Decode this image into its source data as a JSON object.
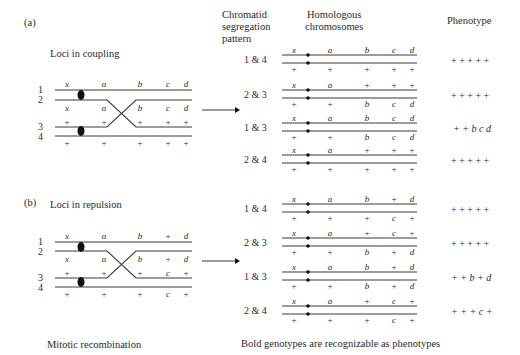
{
  "panel_a": {
    "label": "(a)",
    "title": "Loci in coupling",
    "strand_numbers": [
      "1",
      "2",
      "3",
      "4"
    ],
    "top_pair_labels": [
      "x",
      "a",
      "b",
      "c",
      "d"
    ],
    "bottom_pair_labels": [
      "+",
      "+",
      "+",
      "+",
      "+"
    ],
    "rows": [
      {
        "pattern": "1 & 4",
        "top": [
          "x",
          "a",
          "b",
          "c",
          "d"
        ],
        "bottom": [
          "+",
          "+",
          "+",
          "+",
          "+"
        ],
        "phenotype": "+ + + + +"
      },
      {
        "pattern": "2 & 3",
        "top": [
          "x",
          "a",
          "+",
          "+",
          "+"
        ],
        "bottom": [
          "+",
          "+",
          "b",
          "c",
          "d"
        ],
        "phenotype": "+ + + + +"
      },
      {
        "pattern": "1 & 3",
        "top": [
          "x",
          "a",
          "b",
          "c",
          "d"
        ],
        "bottom": [
          "+",
          "+",
          "b",
          "c",
          "d"
        ],
        "phenotype": "+ + b c d"
      },
      {
        "pattern": "2 & 4",
        "top": [
          "x",
          "a",
          "+",
          "+",
          "+"
        ],
        "bottom": [
          "+",
          "+",
          "+",
          "+",
          "+"
        ],
        "phenotype": "+ + + + +"
      }
    ]
  },
  "panel_b": {
    "label": "(b)",
    "title": "Loci in repulsion",
    "strand_numbers": [
      "1",
      "2",
      "3",
      "4"
    ],
    "top_pair_labels": [
      "x",
      "a",
      "b",
      "+",
      "d"
    ],
    "bottom_pair_labels": [
      "+",
      "+",
      "+",
      "c",
      "+"
    ],
    "rows": [
      {
        "pattern": "1 & 4",
        "top": [
          "x",
          "a",
          "b",
          "+",
          "d"
        ],
        "bottom": [
          "+",
          "+",
          "+",
          "c",
          "+"
        ],
        "phenotype": "+ + + + +"
      },
      {
        "pattern": "2 & 3",
        "top": [
          "x",
          "a",
          "+",
          "c",
          "+"
        ],
        "bottom": [
          "+",
          "+",
          "b",
          "+",
          "d"
        ],
        "phenotype": "+ + + + +"
      },
      {
        "pattern": "1 & 3",
        "top": [
          "x",
          "a",
          "b",
          "+",
          "d"
        ],
        "bottom": [
          "+",
          "+",
          "b",
          "+",
          "d"
        ],
        "phenotype": "+ + b + d"
      },
      {
        "pattern": "2 & 4",
        "top": [
          "x",
          "a",
          "+",
          "c",
          "+"
        ],
        "bottom": [
          "+",
          "+",
          "+",
          "c",
          "+"
        ],
        "phenotype": "+ + + c +"
      }
    ]
  },
  "headers": {
    "segregation_line1": "Chromatid",
    "segregation_line2": "segregation",
    "segregation_line3": "pattern",
    "homologous_line1": "Homologous",
    "homologous_line2": "chromosomes",
    "phenotype": "Phenotype"
  },
  "footer": {
    "left_caption": "Mitotic recombination",
    "right_caption": "Bold genotypes are recognizable as phenotypes"
  },
  "colors": {
    "line": "#3a3a3a",
    "text": "#2a2a2a",
    "background": "#ffffff"
  }
}
